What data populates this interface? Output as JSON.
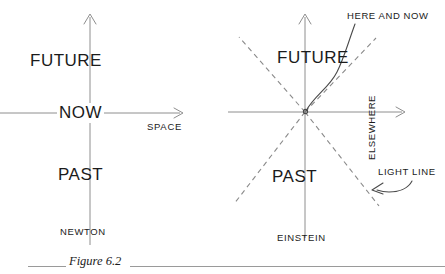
{
  "figure": {
    "caption": "Figure 6.2",
    "background": "#ffffff",
    "ink": "#1b1b1b",
    "line_color": "#8e8e8e",
    "dash_color": "#8a8a8a",
    "rule_color": "#9a9a9a"
  },
  "newton_diagram": {
    "name": "NEWTON",
    "caption": "NEWTON",
    "regions": {
      "future": "FUTURE",
      "now": "NOW",
      "past": "PAST"
    },
    "axes": {
      "horizontal_label": "SPACE",
      "vertical_label": ""
    }
  },
  "einstein_diagram": {
    "name": "EINSTEIN",
    "caption": "EINSTEIN",
    "regions": {
      "future": "FUTURE",
      "past": "PAST",
      "elsewhere": "ELSEWHERE"
    },
    "annotations": {
      "here_and_now": "HERE AND NOW",
      "light_line": "LIGHT LINE"
    }
  }
}
